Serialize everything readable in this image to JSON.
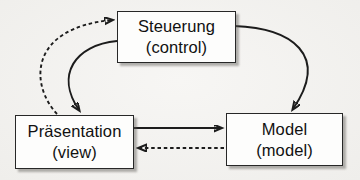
{
  "colors": {
    "background": "#f4f3f0",
    "node_fill": "#fdfdfc",
    "node_border": "#272727",
    "edge": "#1c1c1c",
    "text": "#111111"
  },
  "diagram": {
    "nodes": [
      {
        "id": "control",
        "name": "Steuerung",
        "annotation": "(control)"
      },
      {
        "id": "view",
        "name": "Präsentation",
        "annotation": "(view)"
      },
      {
        "id": "model",
        "name": "Model",
        "annotation": "(model)"
      }
    ],
    "edges": [
      {
        "from": "view",
        "to": "control",
        "style": "dashed"
      },
      {
        "from": "control",
        "to": "view",
        "style": "solid"
      },
      {
        "from": "control",
        "to": "model",
        "style": "solid"
      },
      {
        "from": "view",
        "to": "model",
        "style": "solid"
      },
      {
        "from": "model",
        "to": "view",
        "style": "dashed"
      }
    ]
  }
}
